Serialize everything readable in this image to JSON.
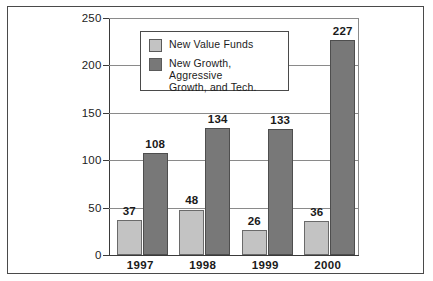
{
  "chart_data": {
    "type": "bar",
    "title": "",
    "subtitle": "",
    "xlabel": "",
    "ylabel": "",
    "categories": [
      "1997",
      "1998",
      "1999",
      "2000"
    ],
    "series": [
      {
        "name": "New Value Funds",
        "color": "#c3c3c3",
        "values": [
          37,
          48,
          26,
          36
        ]
      },
      {
        "name": "New Growth, Aggressive Growth, and Tech.",
        "color": "#787878",
        "values": [
          108,
          134,
          133,
          227
        ]
      }
    ],
    "ylim": [
      0,
      250
    ],
    "yticks": [
      0,
      50,
      100,
      150,
      200,
      250
    ],
    "ytick_labels": [
      "0",
      "50",
      "100",
      "150",
      "200",
      "250"
    ],
    "grid": true,
    "grid_axis": "y",
    "legend_position": "upper-left-inside",
    "data_labels": true
  },
  "legend": {
    "entries": [
      {
        "label": "New Value Funds",
        "swatch": "light"
      },
      {
        "label": "New Growth,  Aggressive Growth, and Tech.",
        "swatch": "dark"
      }
    ],
    "entry_2_line_1": "New Growth,  Aggressive",
    "entry_2_line_2": "Growth, and Tech."
  },
  "colors": {
    "light_bar": "#c3c3c3",
    "dark_bar": "#787878",
    "gridline": "#8a8a8a",
    "axis": "#3a3a3a",
    "frame": "#4a4a4a",
    "text": "#1a1a1a",
    "background": "#ffffff"
  }
}
